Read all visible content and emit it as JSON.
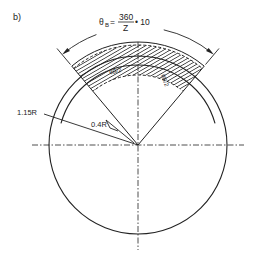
{
  "figure": {
    "panel_label": "b)",
    "formula": {
      "lhs": "θ",
      "lhs_subscript": "B",
      "equals": "=",
      "numerator": "360",
      "denominator": "Z",
      "multiplier": "• 10"
    },
    "labels": {
      "outer_radius": "1.15R",
      "inner_radius": "0.4R",
      "half_angle_left": "θB/2",
      "half_angle_right": "θB/2"
    },
    "colors": {
      "ink": "#222222",
      "paper": "#ffffff"
    }
  }
}
